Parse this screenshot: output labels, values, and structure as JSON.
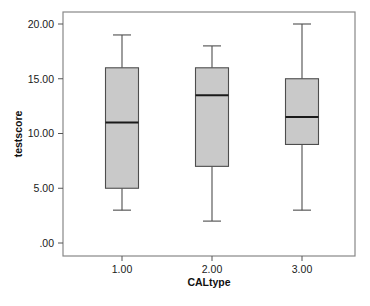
{
  "chart_data": {
    "type": "box",
    "title": "",
    "subtitle": "",
    "xlabel": "CALtype",
    "ylabel": "testscore",
    "categories": [
      "1.00",
      "2.00",
      "3.00"
    ],
    "x_tick_labels": [
      "1.00",
      "2.00",
      "3.00"
    ],
    "y_tick_labels": [
      "20.00",
      "15.00",
      "10.00",
      "5.00",
      ".00"
    ],
    "y_ticks": [
      20,
      15,
      10,
      5,
      0
    ],
    "ylim": [
      0,
      20.8
    ],
    "grid": false,
    "legend": "none",
    "box_fill_color": "#c9c9c9",
    "box_edge_color": "#4d4d4d",
    "median_color": "#1a1a1a",
    "whisker_color": "#4d4d4d",
    "frame_color": "#888888",
    "background_color": "#ffffff",
    "boxes": [
      {
        "category": "1.00",
        "whisker_low": 3.0,
        "q1": 5.0,
        "median": 11.0,
        "q3": 16.0,
        "whisker_high": 19.0,
        "outliers": []
      },
      {
        "category": "2.00",
        "whisker_low": 2.0,
        "q1": 7.0,
        "median": 13.5,
        "q3": 16.0,
        "whisker_high": 18.0,
        "outliers": []
      },
      {
        "category": "3.00",
        "whisker_low": 3.0,
        "q1": 9.0,
        "median": 11.5,
        "q3": 15.0,
        "whisker_high": 20.0,
        "outliers": []
      }
    ]
  }
}
